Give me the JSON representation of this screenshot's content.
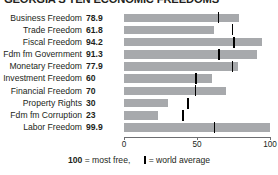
{
  "title": "GEORGIA'S TEN ECONOMIC FREEDOMS",
  "legend": {
    "most_free_number": "100",
    "most_free_text": "= most free,",
    "world_average_text": "= world average",
    "world_average_glyph": "world-average-tick-icon"
  },
  "colors": {
    "bar": "#a7a9ac",
    "tick": "#000000",
    "text": "#231f20",
    "axis": "#6d6e71"
  },
  "chart_data": {
    "type": "bar",
    "title": "GEORGIA'S TEN ECONOMIC FREEDOMS",
    "xlabel": "",
    "ylabel": "",
    "xlim": [
      0,
      100
    ],
    "grid": false,
    "legend_position": "bottom-center",
    "axis_ticks": [
      "0",
      "50",
      "100"
    ],
    "axis_tick_values": [
      0,
      50,
      100
    ],
    "categories": [
      "Business Freedom",
      "Trade Freedom",
      "Fiscal Freedom",
      "Fdm fm Government",
      "Monetary Freedom",
      "Investment Freedom",
      "Financial Freedom",
      "Property Rights",
      "Fdm fm Corruption",
      "Labor Freedom"
    ],
    "values": [
      78.9,
      61.8,
      94.2,
      91.3,
      77.9,
      60,
      70,
      30,
      23,
      99.9
    ],
    "value_labels": [
      "78.9",
      "61.8",
      "94.2",
      "91.3",
      "77.9",
      "60",
      "70",
      "30",
      "23",
      "99.9"
    ],
    "world_average": [
      64.6,
      74.2,
      75.2,
      65.0,
      74.4,
      49.4,
      49.1,
      44.0,
      40.5,
      62.1
    ],
    "series": [
      {
        "name": "Georgia score",
        "values": [
          78.9,
          61.8,
          94.2,
          91.3,
          77.9,
          60,
          70,
          30,
          23,
          99.9
        ]
      },
      {
        "name": "world average",
        "values": [
          64.6,
          74.2,
          75.2,
          65.0,
          74.4,
          49.4,
          49.1,
          44.0,
          40.5,
          62.1
        ]
      }
    ]
  }
}
